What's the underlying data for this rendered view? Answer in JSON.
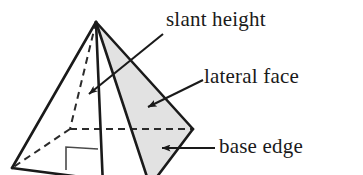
{
  "figure": {
    "type": "geometry-diagram",
    "width": 363,
    "height": 175,
    "background_color": "#ffffff",
    "stroke_color": "#1a1a1a",
    "shaded_face_color": "#e2e2e2"
  },
  "labels": {
    "slant_height": "slant height",
    "lateral_face": "lateral face",
    "base_edge": "base edge"
  },
  "shape": {
    "apex": [
      96,
      22
    ],
    "base_vertices": {
      "right": [
        193,
        129
      ],
      "front": [
        150,
        186
      ],
      "left": [
        12,
        168
      ],
      "back": [
        70,
        129
      ]
    },
    "shaded_face_points": "96,22 193,129 150,186",
    "visible_edges": [
      "96,22 12,168",
      "96,22 150,186",
      "96,22 193,129",
      "193,129 150,186",
      "12,168 150,186"
    ],
    "hidden_edges": [
      "96,22 70,129",
      "70,129 12,168",
      "70,129 193,129"
    ],
    "altitude_edge": "96,22 103,186",
    "right_angle_marker": "66,170 66,147 98,149"
  },
  "leaders": [
    {
      "name": "slant-height-leader",
      "from": [
        163,
        34
      ],
      "to": [
        87,
        95
      ],
      "arrow_at": "to"
    },
    {
      "name": "lateral-face-leader",
      "from": [
        203,
        80
      ],
      "to": [
        146,
        108
      ],
      "arrow_at": "to"
    },
    {
      "name": "base-edge-leader",
      "from": [
        215,
        148
      ],
      "to": [
        160,
        148
      ],
      "arrow_at": "to"
    }
  ]
}
